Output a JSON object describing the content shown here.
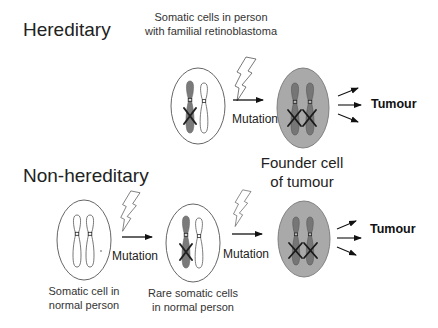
{
  "diagram": {
    "sections": {
      "hereditary": {
        "title": "Hereditary",
        "caption_line1": "Somatic cells in person",
        "caption_line2": "with familial retinoblastoma",
        "mutation_label": "Mutation",
        "tumour_label": "Tumour"
      },
      "non_hereditary": {
        "title": "Non-hereditary",
        "mutation1_label": "Mutation",
        "mutation2_label": "Mutation",
        "tumour_label": "Tumour",
        "cell1_caption_line1": "Somatic cell in",
        "cell1_caption_line2": "normal person",
        "cell2_caption_line1": "Rare somatic cells",
        "cell2_caption_line2": "in normal person"
      }
    },
    "founder_label_line1": "Founder cell",
    "founder_label_line2": "of tumour",
    "colors": {
      "normal_cell_fill": "#ffffff",
      "founder_cell_fill": "#a9a9a9",
      "mutated_chromosome": "#7a7a7a",
      "outline": "#444444"
    }
  }
}
